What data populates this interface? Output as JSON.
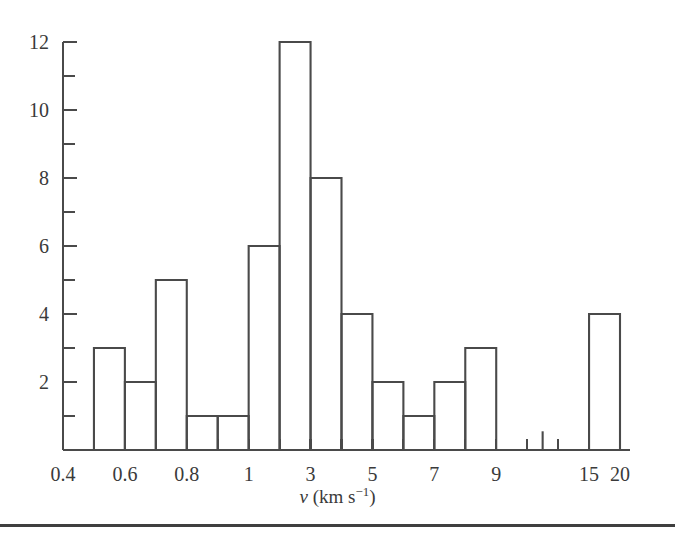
{
  "figure": {
    "background_color": "#ffffff",
    "line_color": "#4a4a4a",
    "footer_rule": true
  },
  "chart_data": {
    "type": "bar",
    "title": "",
    "subtitle": "",
    "xlabel": "v (km s^-1)",
    "xlabel_parts": {
      "symbol": "ν",
      "units_open": " (km s",
      "exponent": "−1",
      "units_close": ")"
    },
    "ylabel": "",
    "xscale": "log",
    "yscale": "linear",
    "ylim": [
      0,
      12
    ],
    "xlim": [
      0.4,
      20
    ],
    "grid": false,
    "legend": null,
    "y_ticks_major": [
      0,
      2,
      4,
      6,
      8,
      10,
      12
    ],
    "y_ticks_major_labels": [
      "",
      "2",
      "4",
      "6",
      "8",
      "10",
      "12"
    ],
    "y_ticks_minor": [
      1,
      3,
      5,
      7,
      9,
      11
    ],
    "x_ticks_labeled": [
      {
        "value": 0.4,
        "label": "0.4"
      },
      {
        "value": 0.6,
        "label": "0.6"
      },
      {
        "value": 0.8,
        "label": "0.8"
      },
      {
        "value": 1,
        "label": "1"
      },
      {
        "value": 3,
        "label": "3"
      },
      {
        "value": 5,
        "label": "5"
      },
      {
        "value": 7,
        "label": "7"
      },
      {
        "value": 9,
        "label": "9"
      },
      {
        "value": 15,
        "label": "15"
      },
      {
        "value": 20,
        "label": "20"
      }
    ],
    "bin_edges_label": [
      "0.4",
      "0.5",
      "0.6",
      "0.7",
      "0.8",
      "0.9",
      "1",
      "2",
      "3",
      "4",
      "5",
      "6",
      "7",
      "8",
      "9",
      "11",
      "13",
      "15",
      "20"
    ],
    "bins": [
      {
        "index": 0,
        "left_label": "0.4",
        "right_label": "0.5",
        "count": 0
      },
      {
        "index": 1,
        "left_label": "0.5",
        "right_label": "0.6",
        "count": 3
      },
      {
        "index": 2,
        "left_label": "0.6",
        "right_label": "0.7",
        "count": 2
      },
      {
        "index": 3,
        "left_label": "0.7",
        "right_label": "0.8",
        "count": 5
      },
      {
        "index": 4,
        "left_label": "0.8",
        "right_label": "0.9",
        "count": 1
      },
      {
        "index": 5,
        "left_label": "0.9",
        "right_label": "1",
        "count": 1
      },
      {
        "index": 6,
        "left_label": "1",
        "right_label": "2",
        "count": 6
      },
      {
        "index": 7,
        "left_label": "2",
        "right_label": "3",
        "count": 12
      },
      {
        "index": 8,
        "left_label": "3",
        "right_label": "4",
        "count": 8
      },
      {
        "index": 9,
        "left_label": "4",
        "right_label": "5",
        "count": 4
      },
      {
        "index": 10,
        "left_label": "5",
        "right_label": "6",
        "count": 2
      },
      {
        "index": 11,
        "left_label": "6",
        "right_label": "7",
        "count": 1
      },
      {
        "index": 12,
        "left_label": "7",
        "right_label": "8",
        "count": 2
      },
      {
        "index": 13,
        "left_label": "8",
        "right_label": "9",
        "count": 3
      },
      {
        "index": 14,
        "left_label": "9",
        "right_label": "11",
        "count": 0
      },
      {
        "index": 15,
        "left_label": "11",
        "right_label": "13",
        "count": 0.55
      },
      {
        "index": 16,
        "left_label": "13",
        "right_label": "15",
        "count": 0
      },
      {
        "index": 17,
        "left_label": "15",
        "right_label": "20",
        "count": 4
      }
    ],
    "values": [
      0,
      3,
      2,
      5,
      1,
      1,
      6,
      12,
      8,
      4,
      2,
      1,
      2,
      3,
      0,
      0.55,
      0,
      4
    ],
    "categories": [
      "0.4-0.5",
      "0.5-0.6",
      "0.6-0.7",
      "0.7-0.8",
      "0.8-0.9",
      "0.9-1",
      "1-2",
      "2-3",
      "3-4",
      "4-5",
      "5-6",
      "6-7",
      "7-8",
      "8-9",
      "9-11",
      "11-13",
      "13-15",
      "15-20"
    ]
  }
}
